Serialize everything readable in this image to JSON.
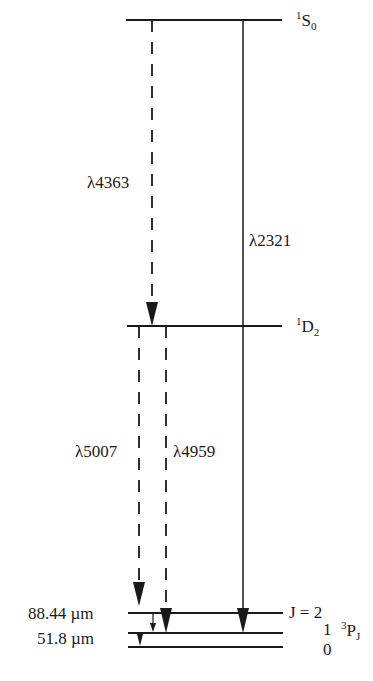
{
  "levels": [
    {
      "id": "1S0",
      "term": "S",
      "mult": "1",
      "j": "0",
      "y": 20
    },
    {
      "id": "1D2",
      "term": "D",
      "mult": "1",
      "j": "2",
      "y": 326
    },
    {
      "id": "3P2",
      "j_label": "J = 2",
      "y": 613
    },
    {
      "id": "3P1",
      "j_label": "1",
      "y": 633
    },
    {
      "id": "3P0",
      "j_label": "0",
      "y": 647
    }
  ],
  "ground_term": {
    "mult": "3",
    "term": "P",
    "j": "J"
  },
  "transitions": [
    {
      "label": "λ4363",
      "from": "1S0",
      "to": "1D2",
      "style": "dashed"
    },
    {
      "label": "λ2321",
      "from": "1S0",
      "to": "3P1",
      "style": "solid"
    },
    {
      "label": "λ5007",
      "from": "1D2",
      "to": "3P2",
      "style": "dashed"
    },
    {
      "label": "λ4959",
      "from": "1D2",
      "to": "3P1",
      "style": "dashed"
    },
    {
      "label": "88.44 µm",
      "from": "3P2",
      "to": "3P1",
      "style": "solid"
    },
    {
      "label": "51.8 µm",
      "from": "3P1",
      "to": "3P0",
      "style": "solid"
    }
  ],
  "labels": {
    "s0_mult": "1",
    "s0_term": "S",
    "s0_j": "0",
    "d2_mult": "1",
    "d2_term": "D",
    "d2_j": "2",
    "j2": "J = 2",
    "j1": "1",
    "j0": "0",
    "p_mult": "3",
    "p_term": "P",
    "p_j": "J",
    "l4363": "λ4363",
    "l2321": "λ2321",
    "l5007": "λ5007",
    "l4959": "λ4959",
    "um88": "88.44 µm",
    "um51": "51.8 µm"
  }
}
